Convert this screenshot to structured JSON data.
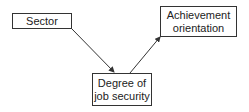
{
  "diagram": {
    "type": "flow",
    "nodes": [
      {
        "id": "sector",
        "label": "Sector"
      },
      {
        "id": "achievement",
        "label": "Achievement orientation",
        "lines": [
          "Achievement",
          "orientation"
        ]
      },
      {
        "id": "degree",
        "label": "Degree of job security",
        "lines": [
          "Degree of",
          "job security"
        ]
      }
    ],
    "edges": [
      {
        "from": "sector",
        "to": "degree"
      },
      {
        "from": "degree",
        "to": "achievement"
      }
    ]
  },
  "colors": {
    "stroke": "#333333",
    "background": "#ffffff"
  }
}
